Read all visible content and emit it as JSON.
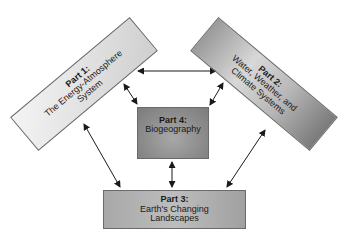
{
  "diagram": {
    "nodes": [
      {
        "id": "part1",
        "title": "Part 1:",
        "lines": [
          "The Energy-Atmosphere",
          "System"
        ]
      },
      {
        "id": "part2",
        "title": "Part 2:",
        "lines": [
          "Water, Weather, and",
          "Climate Systems"
        ]
      },
      {
        "id": "part3",
        "title": "Part 3:",
        "lines": [
          "Earth's Changing",
          "Landscapes"
        ]
      },
      {
        "id": "part4",
        "title": "Part 4:",
        "lines": [
          "Biogeography"
        ]
      }
    ],
    "edges": [
      {
        "from": "part1",
        "to": "part2",
        "type": "bidirectional"
      },
      {
        "from": "part1",
        "to": "part4",
        "type": "bidirectional"
      },
      {
        "from": "part2",
        "to": "part4",
        "type": "bidirectional"
      },
      {
        "from": "part1",
        "to": "part3",
        "type": "bidirectional"
      },
      {
        "from": "part2",
        "to": "part3",
        "type": "bidirectional"
      },
      {
        "from": "part4",
        "to": "part3",
        "type": "bidirectional"
      }
    ],
    "colors": {
      "arrow": "#1a1a1a",
      "border": "#6a6a6a"
    }
  }
}
